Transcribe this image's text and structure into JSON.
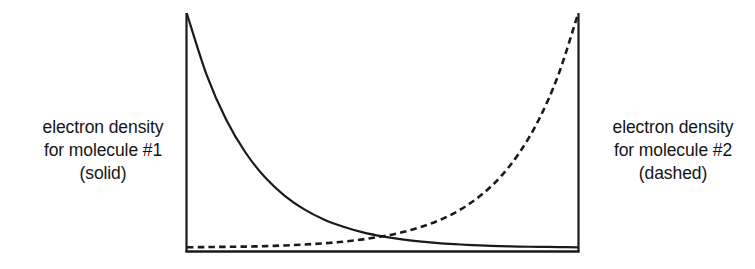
{
  "figure": {
    "name": "electron-density-comparison-figure",
    "background_color": "#ffffff",
    "ink_color": "#1a1a1a"
  },
  "labels": {
    "left": {
      "name": "left-axis-label",
      "lines": [
        "electron density",
        "for molecule #1",
        "(solid)"
      ],
      "line1": "electron density",
      "line2": "for molecule #1",
      "line3": "(solid)"
    },
    "right": {
      "name": "right-axis-label",
      "lines": [
        "electron density",
        "for molecule #2",
        "(dashed)"
      ],
      "line1": "electron density",
      "line2": "for molecule #2",
      "line3": "(dashed)"
    }
  },
  "chart_data": {
    "type": "line",
    "title": "",
    "subtitle": "",
    "xlabel": "",
    "ylabel": "",
    "xlim": [
      0,
      1
    ],
    "ylim": [
      0,
      1
    ],
    "grid": false,
    "legend": "none",
    "axes": {
      "left_axis_visible": true,
      "right_axis_visible": true,
      "bottom_axis_visible": true,
      "top_axis_visible": false,
      "tick_labels_x": [],
      "tick_labels_y": []
    },
    "annotations": [
      {
        "text": "electron density for molecule #1 (solid)",
        "position": "left-outside-axis"
      },
      {
        "text": "electron density for molecule #2 (dashed)",
        "position": "right-outside-axis"
      }
    ],
    "x": [
      0,
      0.05,
      0.1,
      0.15,
      0.2,
      0.25,
      0.3,
      0.35,
      0.4,
      0.45,
      0.5,
      0.55,
      0.6,
      0.65,
      0.7,
      0.75,
      0.8,
      0.85,
      0.9,
      0.95,
      1
    ],
    "series": [
      {
        "name": "electron density for molecule #1",
        "style": "solid",
        "color": "#1a1a1a",
        "values": [
          1.0,
          0.741,
          0.549,
          0.407,
          0.301,
          0.223,
          0.165,
          0.122,
          0.091,
          0.067,
          0.05,
          0.037,
          0.027,
          0.02,
          0.015,
          0.011,
          0.008,
          0.006,
          0.005,
          0.004,
          0.003
        ]
      },
      {
        "name": "electron density for molecule #2",
        "style": "dashed",
        "color": "#1a1a1a",
        "values": [
          0.003,
          0.004,
          0.005,
          0.006,
          0.008,
          0.011,
          0.015,
          0.02,
          0.027,
          0.037,
          0.05,
          0.067,
          0.091,
          0.122,
          0.165,
          0.223,
          0.301,
          0.407,
          0.549,
          0.741,
          1.0
        ]
      }
    ],
    "crossing_point": {
      "x": 0.5,
      "y": 0.05
    }
  }
}
